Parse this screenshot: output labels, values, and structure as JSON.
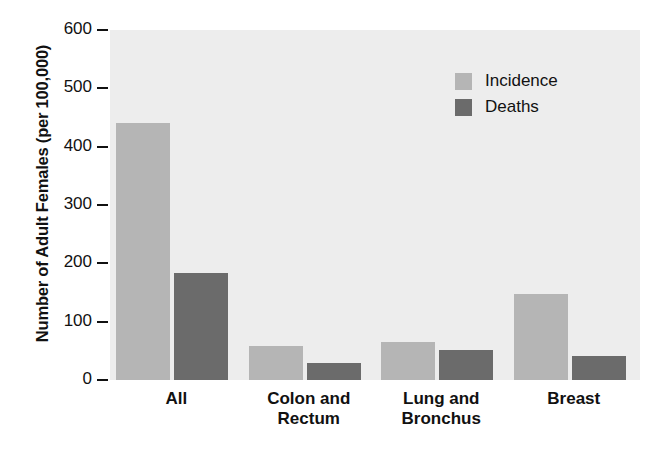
{
  "chart_data": {
    "type": "bar",
    "title": "",
    "xlabel": "",
    "ylabel": "Number of Adult Females (per 100,000)",
    "ylim": [
      0,
      600
    ],
    "yticks": [
      0,
      100,
      200,
      300,
      400,
      500,
      600
    ],
    "ytick_labels": [
      "0",
      "100",
      "200",
      "300",
      "400",
      "500",
      "600"
    ],
    "grid": false,
    "legend_position": "top-right-inside",
    "categories": [
      "All",
      "Colon and\nRectum",
      "Lung and\nBronchus",
      "Breast"
    ],
    "series": [
      {
        "name": "Incidence",
        "color": "#b5b5b5",
        "values": [
          440,
          59,
          65,
          147
        ]
      },
      {
        "name": "Deaths",
        "color": "#6b6b6b",
        "values": [
          183,
          30,
          52,
          42
        ]
      }
    ],
    "colors": {
      "plot_background": "#ededed",
      "page_background": "#ffffff",
      "axis_text": "#111111",
      "incidence": "#b5b5b5",
      "deaths": "#6b6b6b"
    }
  }
}
